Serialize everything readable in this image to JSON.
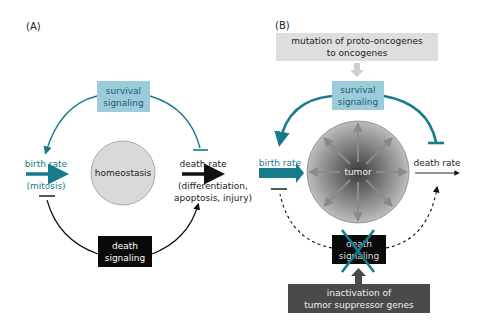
{
  "colors": {
    "teal": "#167b8c",
    "survival_box": "#9ccbdb",
    "death_box": "#0a0a0a",
    "homeostasis_circle": "#d9d9d9",
    "mutation_box": "#dedede",
    "inactivation_box": "#4a4a4a",
    "arrow_gray": "#8a8a8a",
    "text_dark": "#222222"
  },
  "panel_a": {
    "label": "(A)",
    "survival_line1": "survival",
    "survival_line2": "signaling",
    "center": "homeostasis",
    "birth_rate": "birth rate",
    "birth_sub": "(mitosis)",
    "death_rate": "death rate",
    "death_sub1": "(differentiation,",
    "death_sub2": "apoptosis, injury)",
    "death_line1": "death",
    "death_line2": "signaling"
  },
  "panel_b": {
    "label": "(B)",
    "mutation_line1": "mutation of proto-oncogenes",
    "mutation_line2": "to oncogenes",
    "survival_line1": "survival",
    "survival_line2": "signaling",
    "center": "tumor",
    "birth_rate": "birth rate",
    "death_rate": "death rate",
    "death_line1": "death",
    "death_line2": "signaling",
    "inactivation_line1": "inactivation of",
    "inactivation_line2": "tumor suppressor genes"
  }
}
